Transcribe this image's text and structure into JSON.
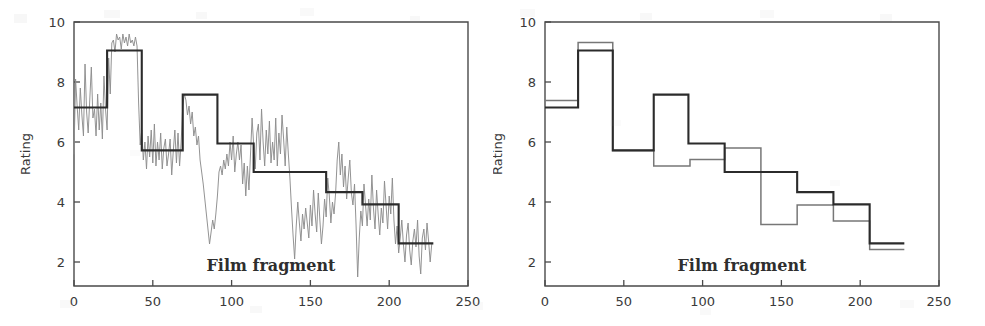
{
  "figure": {
    "panels": [
      {
        "id": "left",
        "name": "noisy-ratings-with-segmentation",
        "axis": {
          "xlabel": "Film fragment",
          "ylabel": "Rating",
          "xticks": [
            "0",
            "50",
            "100",
            "150",
            "200",
            "250"
          ],
          "yticks": [
            "2",
            "4",
            "6",
            "8",
            "10"
          ]
        }
      },
      {
        "id": "right",
        "name": "two-segmentations-comparison",
        "axis": {
          "xlabel": "Film fragment",
          "ylabel": "Rating",
          "xticks": [
            "0",
            "50",
            "100",
            "150",
            "200",
            "250"
          ],
          "yticks": [
            "2",
            "4",
            "6",
            "8",
            "10"
          ]
        }
      }
    ]
  },
  "chart_data": [
    {
      "type": "line",
      "panel": "left",
      "title": "",
      "xlabel": "Film fragment",
      "ylabel": "Rating",
      "xlim": [
        0,
        250
      ],
      "ylim": [
        1.2,
        10
      ],
      "xticks": [
        0,
        50,
        100,
        150,
        200,
        250
      ],
      "yticks": [
        2,
        4,
        6,
        8,
        10
      ],
      "grid": false,
      "legend": "none",
      "series": [
        {
          "name": "Raw rating (noisy)",
          "color": "#8d8d8d",
          "type": "line",
          "x": [
            0,
            1,
            2,
            3,
            4,
            5,
            6,
            7,
            8,
            9,
            10,
            11,
            12,
            13,
            14,
            15,
            16,
            17,
            18,
            19,
            20,
            21,
            22,
            23,
            24,
            25,
            26,
            27,
            28,
            29,
            30,
            31,
            32,
            33,
            34,
            35,
            36,
            37,
            38,
            39,
            40,
            41,
            42,
            43,
            44,
            45,
            46,
            47,
            48,
            49,
            50,
            51,
            52,
            53,
            54,
            55,
            56,
            57,
            58,
            59,
            60,
            61,
            62,
            63,
            64,
            65,
            66,
            67,
            68,
            69,
            70,
            71,
            72,
            73,
            74,
            75,
            76,
            77,
            78,
            79,
            80,
            81,
            82,
            83,
            84,
            85,
            86,
            87,
            88,
            89,
            90,
            91,
            92,
            93,
            94,
            95,
            96,
            97,
            98,
            99,
            100,
            101,
            102,
            103,
            104,
            105,
            106,
            107,
            108,
            109,
            110,
            111,
            112,
            113,
            114,
            115,
            116,
            117,
            118,
            119,
            120,
            121,
            122,
            123,
            124,
            125,
            126,
            127,
            128,
            129,
            130,
            131,
            132,
            133,
            134,
            135,
            136,
            137,
            138,
            139,
            140,
            141,
            142,
            143,
            144,
            145,
            146,
            147,
            148,
            149,
            150,
            151,
            152,
            153,
            154,
            155,
            156,
            157,
            158,
            159,
            160,
            161,
            162,
            163,
            164,
            165,
            166,
            167,
            168,
            169,
            170,
            171,
            172,
            173,
            174,
            175,
            176,
            177,
            178,
            179,
            180,
            181,
            182,
            183,
            184,
            185,
            186,
            187,
            188,
            189,
            190,
            191,
            192,
            193,
            194,
            195,
            196,
            197,
            198,
            199,
            200,
            201,
            202,
            203,
            204,
            205,
            206,
            207,
            208,
            209,
            210,
            211,
            212,
            213,
            214,
            215,
            216,
            217,
            218,
            219,
            220,
            221,
            222,
            223,
            224,
            225,
            226,
            227
          ],
          "y": [
            5.6,
            8.1,
            7.2,
            6.4,
            7.8,
            6.9,
            6.2,
            8.6,
            7.0,
            6.3,
            7.4,
            8.5,
            6.8,
            7.1,
            6.2,
            7.6,
            6.4,
            7.3,
            6.1,
            8.2,
            7.1,
            6.4,
            8.8,
            7.6,
            9.3,
            9.4,
            9.0,
            9.6,
            9.4,
            9.5,
            9.1,
            9.6,
            9.3,
            9.5,
            9.2,
            9.6,
            9.3,
            9.4,
            9.2,
            9.5,
            9.2,
            7.3,
            5.9,
            6.4,
            5.4,
            6.0,
            5.1,
            6.2,
            5.5,
            6.4,
            5.3,
            6.6,
            5.2,
            6.0,
            5.4,
            6.3,
            5.1,
            5.8,
            6.1,
            5.2,
            5.6,
            6.1,
            4.9,
            5.7,
            6.4,
            5.3,
            6.3,
            5.2,
            6.0,
            7.2,
            7.6,
            7.4,
            6.9,
            7.2,
            6.6,
            7.0,
            6.2,
            6.5,
            5.9,
            6.2,
            5.4,
            5.0,
            4.6,
            4.1,
            3.6,
            3.1,
            2.6,
            3.0,
            3.4,
            3.1,
            3.6,
            4.2,
            5.0,
            5.2,
            4.9,
            5.4,
            5.1,
            5.6,
            5.2,
            6.0,
            5.4,
            6.2,
            5.0,
            5.6,
            6.0,
            5.4,
            5.9,
            4.6,
            5.3,
            4.2,
            5.2,
            4.4,
            5.6,
            6.8,
            5.9,
            5.1,
            6.3,
            6.6,
            5.4,
            7.1,
            6.0,
            5.2,
            6.4,
            5.6,
            6.7,
            5.3,
            6.0,
            5.4,
            6.8,
            5.2,
            6.3,
            5.6,
            6.9,
            6.1,
            5.2,
            6.5,
            5.6,
            4.8,
            3.8,
            2.9,
            2.1,
            3.2,
            4.0,
            3.3,
            2.7,
            3.6,
            3.1,
            3.8,
            3.3,
            2.8,
            3.9,
            3.2,
            4.4,
            3.6,
            3.0,
            4.3,
            3.4,
            2.6,
            3.2,
            4.1,
            3.5,
            4.8,
            4.2,
            3.3,
            4.0,
            3.6,
            4.3,
            5.4,
            6.0,
            4.9,
            5.6,
            4.5,
            5.2,
            4.1,
            4.8,
            5.4,
            4.3,
            3.9,
            4.6,
            3.2,
            1.5,
            2.8,
            3.7,
            3.2,
            4.6,
            3.9,
            3.2,
            4.1,
            3.4,
            4.9,
            3.8,
            3.1,
            4.4,
            3.6,
            2.9,
            3.8,
            3.3,
            4.7,
            3.9,
            3.1,
            4.2,
            3.6,
            4.8,
            3.4,
            2.6,
            3.2,
            2.3,
            2.8,
            3.4,
            2.6,
            2.0,
            2.9,
            3.3,
            2.4,
            1.9,
            2.7,
            3.1,
            2.5,
            3.4,
            2.2,
            1.6,
            2.8,
            3.1,
            2.4,
            3.3,
            2.7,
            2.0,
            2.6,
            1.8,
            2.4,
            1.5
          ]
        },
        {
          "name": "Fitted piecewise-constant segmentation",
          "color": "#2b2b2b",
          "type": "step",
          "breakpoints": [
            0,
            21,
            43,
            69,
            91,
            114,
            160,
            183,
            206,
            228
          ],
          "levels": [
            7.15,
            9.05,
            5.72,
            7.58,
            5.95,
            5.0,
            4.33,
            3.92,
            2.62
          ]
        }
      ]
    },
    {
      "type": "line",
      "panel": "right",
      "title": "",
      "xlabel": "Film fragment",
      "ylabel": "Rating",
      "xlim": [
        0,
        250
      ],
      "ylim": [
        1.2,
        10
      ],
      "xticks": [
        0,
        50,
        100,
        150,
        200,
        250
      ],
      "yticks": [
        2,
        4,
        6,
        8,
        10
      ],
      "grid": false,
      "legend": "none",
      "series": [
        {
          "name": "Segmentation A",
          "color": "#2b2b2b",
          "type": "step",
          "breakpoints": [
            0,
            21,
            43,
            69,
            91,
            114,
            160,
            183,
            206,
            228
          ],
          "levels": [
            7.15,
            9.05,
            5.72,
            7.58,
            5.95,
            5.0,
            4.33,
            3.92,
            2.62
          ]
        },
        {
          "name": "Segmentation B",
          "color": "#777777",
          "type": "step",
          "breakpoints": [
            0,
            21,
            43,
            69,
            92,
            114,
            137,
            160,
            183,
            206,
            228
          ],
          "levels": [
            7.38,
            9.32,
            5.72,
            5.2,
            5.42,
            5.8,
            3.25,
            3.9,
            3.37,
            2.42
          ]
        }
      ]
    }
  ]
}
